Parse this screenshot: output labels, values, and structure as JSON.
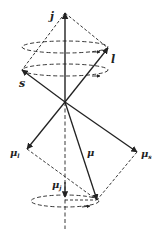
{
  "diagram": {
    "labels": {
      "j": "j",
      "l": "l",
      "s": "s",
      "mu_l_base": "μ",
      "mu_l_sub": "l",
      "mu_s_base": "μ",
      "mu_s_sub": "s",
      "mu": "μ",
      "mu_j_base": "μ",
      "mu_j_sub": "j"
    },
    "colors": {
      "line": "#222222",
      "background": "#ffffff"
    }
  }
}
